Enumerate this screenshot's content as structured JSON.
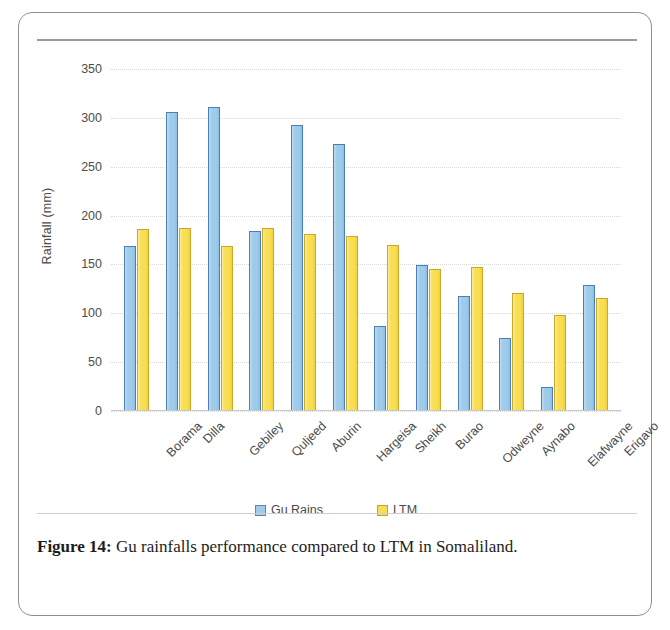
{
  "figure": {
    "caption_label": "Figure 14:",
    "caption_text": " Gu rainfalls performance compared to LTM in Somaliland."
  },
  "chart_data": {
    "type": "bar",
    "title": "",
    "xlabel": "",
    "ylabel": "Rainfall (mm)",
    "ylim": [
      0,
      350
    ],
    "ytick_step": 50,
    "yticks": [
      350,
      300,
      250,
      200,
      150,
      100,
      50,
      0
    ],
    "grid": true,
    "legend_position": "bottom",
    "categories": [
      "Borama",
      "Dilla",
      "Gebiley",
      "Quljeed",
      "Aburin",
      "Hargeisa",
      "Sheikh",
      "Burao",
      "Odweyne",
      "Aynabo",
      "Elafwayne",
      "Erigavo"
    ],
    "series": [
      {
        "name": "Gu Rains",
        "color": "#9ecbea",
        "values": [
          169,
          306,
          311,
          184,
          293,
          273,
          87,
          149,
          118,
          75,
          25,
          129
        ]
      },
      {
        "name": "LTM",
        "color": "#f8de52",
        "values": [
          186,
          187,
          169,
          187,
          181,
          179,
          170,
          145,
          147,
          121,
          98,
          116
        ]
      }
    ]
  }
}
